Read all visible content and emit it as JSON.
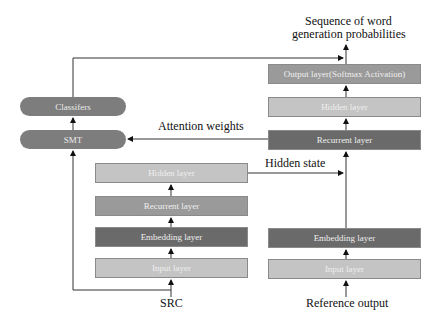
{
  "left_stack": {
    "classifiers": "Classifers",
    "smt": "SMT"
  },
  "encoder": {
    "hidden": "Hidden layer",
    "recurrent": "Recurrent layer",
    "embedding": "Embedding layer",
    "input": "Input layer",
    "source_label": "SRC"
  },
  "decoder": {
    "output": "Output layer(Softmax Activation)",
    "hidden": "Hidden layer",
    "recurrent": "Recurrent layer",
    "embedding": "Embedding layer",
    "input": "Input layer",
    "source_label": "Reference output"
  },
  "labels": {
    "top_output_line1": "Sequence of word",
    "top_output_line2": "generation probabilities",
    "attention": "Attention weights",
    "hidden_state": "Hidden state"
  },
  "colors": {
    "light": "#c4c4c4",
    "mid": "#9a9a9a",
    "dark": "#6a6a6a",
    "pill": "#7d7d7d"
  }
}
